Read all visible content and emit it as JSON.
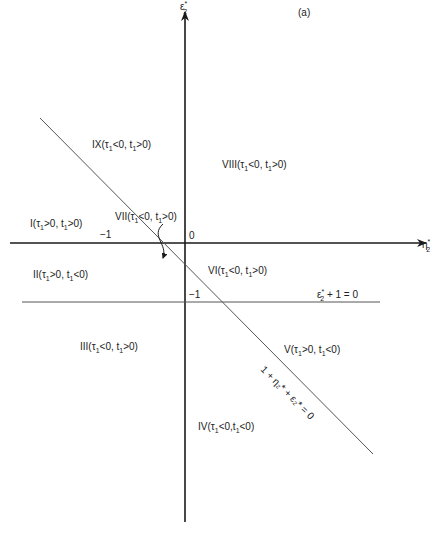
{
  "figure": {
    "panel_label": "(a)",
    "axes": {
      "x_label": "η",
      "x_sub": "2",
      "x_sup": "*",
      "y_label": "ε",
      "y_sub": "2",
      "y_sup": "*",
      "origin_label": "0",
      "x_intercept_label": "−1",
      "y_intercept_label": "−1"
    },
    "lines": {
      "horizontal_eq": {
        "pre": "ε",
        "sub": "2",
        "sup": "*",
        "post": " + 1 = 0"
      },
      "diagonal_eq": "1 + η₂* + ε₂* = 0"
    },
    "regions": [
      {
        "id": "I",
        "roman": "I",
        "tau": "τ",
        "tau_rel": ">0",
        "t_rel": ">0"
      },
      {
        "id": "II",
        "roman": "II",
        "tau": "τ",
        "tau_rel": ">0",
        "t_rel": "<0"
      },
      {
        "id": "III",
        "roman": "III",
        "tau": "τ",
        "tau_rel": "<0",
        "t_rel": ">0"
      },
      {
        "id": "IV",
        "roman": "IV",
        "tau": "τ",
        "tau_rel": "<0",
        "t_rel": "<0"
      },
      {
        "id": "V",
        "roman": "V",
        "tau": "τ",
        "tau_rel": ">0",
        "t_rel": "<0"
      },
      {
        "id": "VI",
        "roman": "VI",
        "tau": "τ",
        "tau_rel": "<0",
        "t_rel": ">0"
      },
      {
        "id": "VII",
        "roman": "VII",
        "tau": "τ",
        "tau_rel": "<0",
        "t_rel": ">0"
      },
      {
        "id": "VIII",
        "roman": "VIII",
        "tau": "τ",
        "tau_rel": "<0",
        "t_rel": ">0"
      },
      {
        "id": "IX",
        "roman": "IX",
        "tau": "τ",
        "tau_rel": "<0",
        "t_rel": ">0"
      }
    ],
    "colors": {
      "axis": "#1a1a1a",
      "line": "#555555",
      "text": "#222222"
    }
  }
}
